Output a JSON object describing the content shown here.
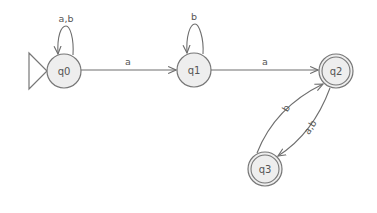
{
  "diagram": {
    "type": "finite-automaton",
    "colors": {
      "state_fill": "#eeeeee",
      "stroke": "#777777",
      "text": "#555555",
      "background": "#ffffff"
    },
    "states": [
      {
        "id": "q0",
        "label": "q0",
        "initial": true,
        "accepting": false
      },
      {
        "id": "q1",
        "label": "q1",
        "initial": false,
        "accepting": false
      },
      {
        "id": "q2",
        "label": "q2",
        "initial": false,
        "accepting": true
      },
      {
        "id": "q3",
        "label": "q3",
        "initial": false,
        "accepting": true
      }
    ],
    "transitions": [
      {
        "from": "q0",
        "to": "q0",
        "label": "a,b"
      },
      {
        "from": "q0",
        "to": "q1",
        "label": "a"
      },
      {
        "from": "q1",
        "to": "q1",
        "label": "b"
      },
      {
        "from": "q1",
        "to": "q2",
        "label": "a"
      },
      {
        "from": "q3",
        "to": "q2",
        "label": "b"
      },
      {
        "from": "q2",
        "to": "q3",
        "label": "a,b"
      }
    ]
  }
}
